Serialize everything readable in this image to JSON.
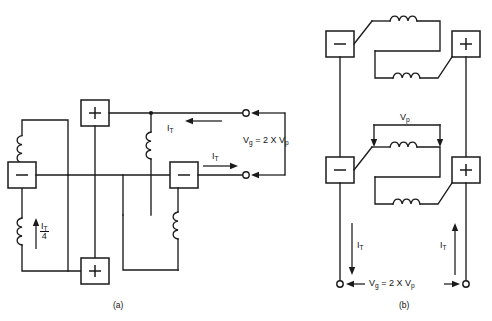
{
  "figure": {
    "background_color": "#ffffff",
    "line_color": "#1a1a1a",
    "width": 492,
    "height": 321
  },
  "panel_a": {
    "caption": "(a)",
    "voltage_equation": "Vg = 2 X Vₚ",
    "voltage_equation_parts": {
      "lhs": "V",
      "lhs_sub": "g",
      "operator": "=",
      "factor": "2 X",
      "rhs": "V",
      "rhs_sub": "p"
    },
    "current_label_top": "I",
    "current_label_top_sub": "T",
    "current_label_right": "I",
    "current_label_right_sub": "T",
    "current_fraction_numerator": "I",
    "current_fraction_numerator_sub": "T",
    "current_fraction_denominator": "4",
    "polarity_symbols": [
      "+",
      "−",
      "−",
      "+"
    ],
    "coil_count": 4,
    "terminal_count": 2
  },
  "panel_b": {
    "caption": "(b)",
    "voltage_equation_parts": {
      "lhs": "V",
      "lhs_sub": "g",
      "operator": "=",
      "factor": "2 X",
      "rhs": "V",
      "rhs_sub": "p"
    },
    "primary_voltage_label": "V",
    "primary_voltage_label_sub": "p",
    "current_label_left": "I",
    "current_label_left_sub": "T",
    "current_label_right": "I",
    "current_label_right_sub": "T",
    "polarity_symbols": [
      "−",
      "+",
      "−",
      "+"
    ],
    "coil_count": 4,
    "terminal_count": 2
  }
}
